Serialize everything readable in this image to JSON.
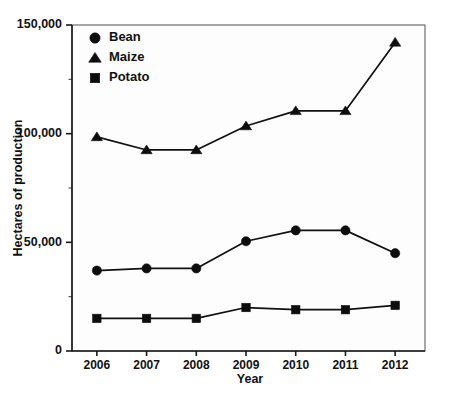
{
  "chart_data": {
    "type": "line",
    "title": "",
    "subtitle": "",
    "xlabel": "Year",
    "ylabel": "Hectares of production",
    "categories": [
      "2006",
      "2007",
      "2008",
      "2009",
      "2010",
      "2011",
      "2012"
    ],
    "x": [
      2006,
      2007,
      2008,
      2009,
      2010,
      2011,
      2012
    ],
    "xlim": [
      2005.5,
      2012.6
    ],
    "ylim": [
      0,
      150000
    ],
    "y_major_ticks": [
      0,
      50000,
      100000,
      150000
    ],
    "y_minor_ticks": [
      25000,
      75000,
      125000
    ],
    "y_tick_labels": [
      "0",
      "50,000",
      "100,000",
      "150,000"
    ],
    "grid": false,
    "legend_position": "top-left",
    "series": [
      {
        "name": "Bean",
        "marker": "circle",
        "color": "#0d0d0d",
        "values": [
          37000,
          38000,
          38000,
          50500,
          55500,
          55500,
          45000
        ]
      },
      {
        "name": "Maize",
        "marker": "triangle",
        "color": "#0d0d0d",
        "values": [
          98500,
          92500,
          92500,
          103500,
          110500,
          110500,
          142000
        ]
      },
      {
        "name": "Potato",
        "marker": "square",
        "color": "#0d0d0d",
        "values": [
          15000,
          15000,
          15000,
          20000,
          19000,
          19000,
          21000
        ]
      }
    ]
  },
  "legend": {
    "items": [
      {
        "label": "Bean",
        "marker": "circle"
      },
      {
        "label": "Maize",
        "marker": "triangle"
      },
      {
        "label": "Potato",
        "marker": "square"
      }
    ]
  },
  "axes": {
    "y_title": "Hectares of production",
    "x_title": "Year",
    "y_labels": [
      "150,000",
      "100,000",
      "50,000",
      "0"
    ],
    "x_labels": [
      "2006",
      "2007",
      "2008",
      "2009",
      "2010",
      "2011",
      "2012"
    ]
  },
  "colors": {
    "ink": "#0d0d0d",
    "frame": "#6d6d6d",
    "plot_background": "#fdfdfd",
    "page_background": "#ffffff"
  }
}
